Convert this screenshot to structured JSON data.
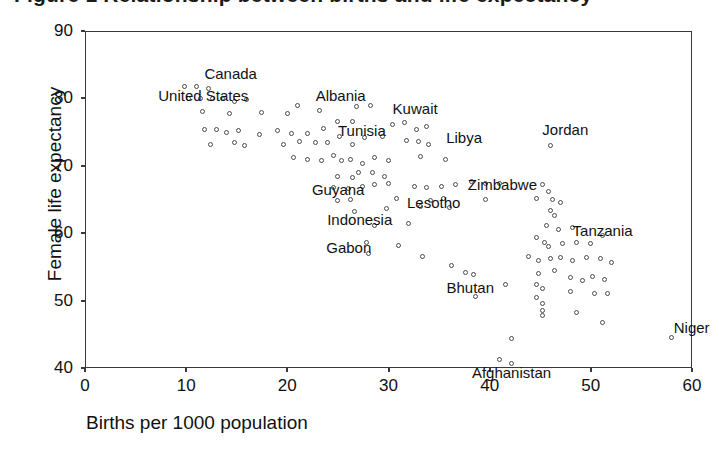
{
  "title": {
    "text": "Figure 1  Relationship between births and life expectancy"
  },
  "chart_data": {
    "type": "scatter",
    "title": "",
    "xlabel": "Births per 1000 population",
    "ylabel": "Female life expectancy",
    "xlim": [
      0,
      60
    ],
    "ylim": [
      40,
      90
    ],
    "xticks": [
      0,
      10,
      20,
      30,
      40,
      50,
      60
    ],
    "yticks": [
      40,
      50,
      60,
      70,
      80,
      90
    ],
    "grid": false,
    "legend": null,
    "marker": "open-circle",
    "annotations": [
      {
        "label": "Canada",
        "x": 12.2,
        "y": 81.5
      },
      {
        "label": "United States",
        "x": 10.4,
        "y": 80.0
      },
      {
        "label": "Albania",
        "x": 23.0,
        "y": 78.0
      },
      {
        "label": "Tunisia",
        "x": 25.4,
        "y": 74.5
      },
      {
        "label": "Guyana",
        "x": 25.0,
        "y": 68.2
      },
      {
        "label": "Kuwait",
        "x": 31.0,
        "y": 76.0
      },
      {
        "label": "Libya",
        "x": 35.5,
        "y": 72.0
      },
      {
        "label": "Jordan",
        "x": 46.0,
        "y": 73.0
      },
      {
        "label": "Indonesia",
        "x": 27.5,
        "y": 63.5
      },
      {
        "label": "Lesotho",
        "x": 34.0,
        "y": 66.0
      },
      {
        "label": "Zimbabwe",
        "x": 41.0,
        "y": 66.5
      },
      {
        "label": "Gabon",
        "x": 28.0,
        "y": 57.5
      },
      {
        "label": "Tanzania",
        "x": 48.0,
        "y": 59.5
      },
      {
        "label": "Bhutan",
        "x": 38.5,
        "y": 51.0
      },
      {
        "label": "Afghanistan",
        "x": 42.0,
        "y": 41.0
      },
      {
        "label": "Niger",
        "x": 58.0,
        "y": 44.5
      }
    ],
    "points": [
      {
        "x": 9.8,
        "y": 81.8
      },
      {
        "x": 11.0,
        "y": 81.8
      },
      {
        "x": 12.2,
        "y": 81.5
      },
      {
        "x": 10.2,
        "y": 80.0
      },
      {
        "x": 11.4,
        "y": 80.0
      },
      {
        "x": 12.6,
        "y": 80.0
      },
      {
        "x": 13.6,
        "y": 80.0
      },
      {
        "x": 14.8,
        "y": 79.6
      },
      {
        "x": 16.0,
        "y": 79.8
      },
      {
        "x": 11.6,
        "y": 78.0
      },
      {
        "x": 14.3,
        "y": 77.8
      },
      {
        "x": 17.4,
        "y": 77.9
      },
      {
        "x": 20.0,
        "y": 77.8
      },
      {
        "x": 21.0,
        "y": 79.0
      },
      {
        "x": 23.2,
        "y": 78.2
      },
      {
        "x": 26.8,
        "y": 78.8
      },
      {
        "x": 28.2,
        "y": 78.9
      },
      {
        "x": 11.8,
        "y": 75.4
      },
      {
        "x": 13.0,
        "y": 75.4
      },
      {
        "x": 14.0,
        "y": 75.0
      },
      {
        "x": 15.2,
        "y": 75.2
      },
      {
        "x": 17.2,
        "y": 74.6
      },
      {
        "x": 19.0,
        "y": 75.2
      },
      {
        "x": 20.4,
        "y": 74.8
      },
      {
        "x": 22.0,
        "y": 74.8
      },
      {
        "x": 23.6,
        "y": 75.6
      },
      {
        "x": 25.0,
        "y": 76.6
      },
      {
        "x": 26.4,
        "y": 76.6
      },
      {
        "x": 30.4,
        "y": 76.2
      },
      {
        "x": 31.6,
        "y": 76.4
      },
      {
        "x": 32.8,
        "y": 75.4
      },
      {
        "x": 33.8,
        "y": 75.8
      },
      {
        "x": 12.4,
        "y": 73.2
      },
      {
        "x": 14.8,
        "y": 73.4
      },
      {
        "x": 15.8,
        "y": 73.0
      },
      {
        "x": 19.6,
        "y": 73.2
      },
      {
        "x": 21.2,
        "y": 73.6
      },
      {
        "x": 22.8,
        "y": 73.4
      },
      {
        "x": 24.0,
        "y": 73.4
      },
      {
        "x": 25.2,
        "y": 74.4
      },
      {
        "x": 26.4,
        "y": 73.2
      },
      {
        "x": 27.6,
        "y": 74.2
      },
      {
        "x": 29.4,
        "y": 74.4
      },
      {
        "x": 31.8,
        "y": 73.8
      },
      {
        "x": 33.0,
        "y": 73.6
      },
      {
        "x": 34.0,
        "y": 73.2
      },
      {
        "x": 46.0,
        "y": 73.0
      },
      {
        "x": 20.6,
        "y": 71.2
      },
      {
        "x": 22.0,
        "y": 71.0
      },
      {
        "x": 23.4,
        "y": 70.8
      },
      {
        "x": 24.6,
        "y": 71.6
      },
      {
        "x": 25.4,
        "y": 70.8
      },
      {
        "x": 26.2,
        "y": 71.0
      },
      {
        "x": 27.4,
        "y": 70.4
      },
      {
        "x": 28.6,
        "y": 71.2
      },
      {
        "x": 30.0,
        "y": 70.8
      },
      {
        "x": 33.2,
        "y": 71.4
      },
      {
        "x": 35.6,
        "y": 71.0
      },
      {
        "x": 25.0,
        "y": 68.4
      },
      {
        "x": 26.4,
        "y": 68.2
      },
      {
        "x": 27.0,
        "y": 69.0
      },
      {
        "x": 28.4,
        "y": 69.0
      },
      {
        "x": 29.6,
        "y": 68.4
      },
      {
        "x": 24.6,
        "y": 66.8
      },
      {
        "x": 26.0,
        "y": 66.6
      },
      {
        "x": 27.4,
        "y": 67.0
      },
      {
        "x": 28.6,
        "y": 67.2
      },
      {
        "x": 30.0,
        "y": 67.4
      },
      {
        "x": 32.6,
        "y": 67.0
      },
      {
        "x": 33.8,
        "y": 66.8
      },
      {
        "x": 35.2,
        "y": 67.0
      },
      {
        "x": 36.6,
        "y": 67.2
      },
      {
        "x": 38.2,
        "y": 67.6
      },
      {
        "x": 39.6,
        "y": 67.4
      },
      {
        "x": 41.0,
        "y": 67.4
      },
      {
        "x": 45.2,
        "y": 67.2
      },
      {
        "x": 45.8,
        "y": 66.2
      },
      {
        "x": 25.0,
        "y": 64.8
      },
      {
        "x": 26.2,
        "y": 65.0
      },
      {
        "x": 30.8,
        "y": 65.2
      },
      {
        "x": 34.2,
        "y": 64.8
      },
      {
        "x": 35.4,
        "y": 65.2
      },
      {
        "x": 39.6,
        "y": 65.0
      },
      {
        "x": 44.6,
        "y": 65.2
      },
      {
        "x": 46.2,
        "y": 65.0
      },
      {
        "x": 47.0,
        "y": 64.6
      },
      {
        "x": 26.6,
        "y": 63.2
      },
      {
        "x": 29.8,
        "y": 63.6
      },
      {
        "x": 33.2,
        "y": 64.0
      },
      {
        "x": 36.0,
        "y": 63.8
      },
      {
        "x": 46.0,
        "y": 63.4
      },
      {
        "x": 46.4,
        "y": 62.6
      },
      {
        "x": 28.6,
        "y": 61.2
      },
      {
        "x": 32.0,
        "y": 61.4
      },
      {
        "x": 45.6,
        "y": 61.2
      },
      {
        "x": 46.8,
        "y": 60.6
      },
      {
        "x": 48.2,
        "y": 60.8
      },
      {
        "x": 27.8,
        "y": 58.6
      },
      {
        "x": 31.0,
        "y": 58.2
      },
      {
        "x": 44.6,
        "y": 59.4
      },
      {
        "x": 45.4,
        "y": 58.6
      },
      {
        "x": 45.8,
        "y": 58.0
      },
      {
        "x": 47.2,
        "y": 58.4
      },
      {
        "x": 48.6,
        "y": 58.6
      },
      {
        "x": 50.0,
        "y": 58.4
      },
      {
        "x": 51.2,
        "y": 59.6
      },
      {
        "x": 28.0,
        "y": 57.0
      },
      {
        "x": 33.4,
        "y": 56.6
      },
      {
        "x": 36.2,
        "y": 55.2
      },
      {
        "x": 43.8,
        "y": 56.6
      },
      {
        "x": 44.8,
        "y": 56.0
      },
      {
        "x": 46.0,
        "y": 56.2
      },
      {
        "x": 47.0,
        "y": 56.4
      },
      {
        "x": 48.2,
        "y": 56.0
      },
      {
        "x": 49.6,
        "y": 56.4
      },
      {
        "x": 51.0,
        "y": 56.2
      },
      {
        "x": 52.0,
        "y": 55.6
      },
      {
        "x": 37.6,
        "y": 54.2
      },
      {
        "x": 38.4,
        "y": 53.8
      },
      {
        "x": 44.8,
        "y": 54.0
      },
      {
        "x": 46.4,
        "y": 54.4
      },
      {
        "x": 48.0,
        "y": 53.4
      },
      {
        "x": 49.2,
        "y": 53.0
      },
      {
        "x": 50.2,
        "y": 53.6
      },
      {
        "x": 51.4,
        "y": 53.2
      },
      {
        "x": 41.6,
        "y": 52.4
      },
      {
        "x": 44.6,
        "y": 52.4
      },
      {
        "x": 45.2,
        "y": 51.8
      },
      {
        "x": 48.0,
        "y": 51.4
      },
      {
        "x": 50.4,
        "y": 51.0
      },
      {
        "x": 51.6,
        "y": 51.0
      },
      {
        "x": 38.6,
        "y": 50.6
      },
      {
        "x": 44.6,
        "y": 50.4
      },
      {
        "x": 45.2,
        "y": 49.6
      },
      {
        "x": 45.2,
        "y": 48.6
      },
      {
        "x": 45.2,
        "y": 47.8
      },
      {
        "x": 48.6,
        "y": 48.2
      },
      {
        "x": 51.2,
        "y": 46.8
      },
      {
        "x": 58.0,
        "y": 44.5
      },
      {
        "x": 42.2,
        "y": 44.4
      },
      {
        "x": 41.0,
        "y": 41.2
      },
      {
        "x": 42.2,
        "y": 40.6
      }
    ]
  }
}
